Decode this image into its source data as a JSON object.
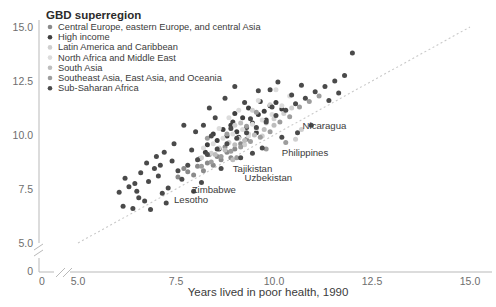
{
  "chart_data": {
    "type": "scatter",
    "title": "",
    "xlabel": "Years lived in poor health, 1990",
    "ylabel": "",
    "xlim": [
      5.0,
      15.0
    ],
    "ylim": [
      5.0,
      15.0
    ],
    "xticks": [
      "0",
      "5.0",
      "7.5",
      "10.0",
      "12.5",
      "15.0"
    ],
    "yticks": [
      "0",
      "5.0",
      "7.5",
      "10.0",
      "12.5",
      "15.0"
    ],
    "axis_break": true,
    "grid": false,
    "reference_line": {
      "type": "identity",
      "style": "dotted",
      "from": [
        5.0,
        5.0
      ],
      "to": [
        15.0,
        15.0
      ]
    },
    "legend": {
      "title": "GBD superregion",
      "position": "top-left",
      "entries": [
        {
          "label": "Central Europe, eastern Europe, and central Asia",
          "color": "#8a8a8a"
        },
        {
          "label": "High income",
          "color": "#3f3f3f"
        },
        {
          "label": "Latin America and Caribbean",
          "color": "#cfcfcf"
        },
        {
          "label": "North Africa and Middle East",
          "color": "#dcdcdc"
        },
        {
          "label": "South Asia",
          "color": "#bdbdbd"
        },
        {
          "label": "Southeast Asia, East Asia, and Oceania",
          "color": "#9d9d9d"
        },
        {
          "label": "Sub-Saharan Africa",
          "color": "#4a4a4a"
        }
      ]
    },
    "annotations": [
      {
        "text": "Nicaragua",
        "x": 10.73,
        "y": 10.3
      },
      {
        "text": "Philippines",
        "x": 10.2,
        "y": 9.05
      },
      {
        "text": "Tajikistan",
        "x": 8.95,
        "y": 8.3
      },
      {
        "text": "Uzbekistan",
        "x": 9.25,
        "y": 7.85
      },
      {
        "text": "Zimbabwe",
        "x": 7.9,
        "y": 7.3
      },
      {
        "text": "Lesotho",
        "x": 7.45,
        "y": 6.85
      }
    ],
    "series": [
      {
        "name": "Central Europe, eastern Europe, and central Asia",
        "color": "#8a8a8a",
        "points": [
          [
            7.55,
            8.05
          ],
          [
            7.8,
            8.3
          ],
          [
            8.05,
            8.55
          ],
          [
            8.3,
            8.7
          ],
          [
            8.55,
            9.0
          ],
          [
            8.8,
            9.2
          ],
          [
            8.2,
            8.35
          ],
          [
            8.65,
            8.85
          ],
          [
            7.95,
            8.15
          ],
          [
            9.0,
            9.35
          ],
          [
            8.45,
            8.6
          ],
          [
            8.1,
            8.9
          ],
          [
            8.75,
            9.45
          ],
          [
            9.15,
            9.6
          ],
          [
            7.7,
            8.45
          ],
          [
            8.9,
            8.95
          ],
          [
            8.35,
            9.1
          ],
          [
            9.3,
            9.8
          ]
        ]
      },
      {
        "name": "High income",
        "color": "#3f3f3f",
        "points": [
          [
            8.3,
            9.55
          ],
          [
            8.55,
            9.75
          ],
          [
            8.8,
            9.95
          ],
          [
            9.05,
            10.15
          ],
          [
            9.3,
            10.35
          ],
          [
            8.95,
            10.6
          ],
          [
            9.2,
            10.8
          ],
          [
            8.7,
            10.25
          ],
          [
            9.45,
            10.55
          ],
          [
            9.6,
            10.95
          ],
          [
            8.45,
            10.05
          ],
          [
            9.75,
            11.1
          ],
          [
            9.1,
            9.9
          ],
          [
            8.9,
            10.45
          ],
          [
            9.35,
            11.25
          ],
          [
            9.9,
            11.35
          ],
          [
            8.6,
            9.35
          ],
          [
            10.05,
            11.5
          ],
          [
            9.55,
            10.1
          ],
          [
            9.8,
            10.7
          ],
          [
            10.2,
            11.2
          ],
          [
            9.0,
            11.0
          ],
          [
            8.25,
            9.2
          ],
          [
            9.65,
            11.55
          ]
        ]
      },
      {
        "name": "Latin America and Caribbean",
        "color": "#cfcfcf",
        "points": [
          [
            8.6,
            9.4
          ],
          [
            8.85,
            9.65
          ],
          [
            9.1,
            9.85
          ],
          [
            9.35,
            10.05
          ],
          [
            9.55,
            10.3
          ],
          [
            9.8,
            10.55
          ],
          [
            8.4,
            9.15
          ],
          [
            10.0,
            10.75
          ],
          [
            9.25,
            9.55
          ],
          [
            10.25,
            11.0
          ],
          [
            9.7,
            9.95
          ],
          [
            10.45,
            11.25
          ],
          [
            9.0,
            10.45
          ],
          [
            10.7,
            10.25
          ],
          [
            9.9,
            11.4
          ],
          [
            8.15,
            8.95
          ],
          [
            10.55,
            9.8
          ],
          [
            9.45,
            11.15
          ]
        ]
      },
      {
        "name": "North Africa and Middle East",
        "color": "#dcdcdc",
        "points": [
          [
            8.45,
            9.6
          ],
          [
            8.7,
            9.85
          ],
          [
            8.95,
            10.05
          ],
          [
            9.2,
            10.25
          ],
          [
            9.45,
            10.5
          ],
          [
            9.7,
            10.7
          ],
          [
            8.2,
            9.4
          ],
          [
            9.95,
            10.95
          ],
          [
            9.1,
            11.15
          ],
          [
            10.2,
            11.35
          ],
          [
            8.85,
            10.8
          ],
          [
            9.6,
            11.6
          ],
          [
            10.4,
            11.8
          ],
          [
            9.35,
            9.95
          ],
          [
            8.6,
            10.3
          ],
          [
            10.05,
            12.1
          ]
        ]
      },
      {
        "name": "South Asia",
        "color": "#bdbdbd",
        "points": [
          [
            8.75,
            9.3
          ],
          [
            9.0,
            9.55
          ],
          [
            9.25,
            9.75
          ],
          [
            9.5,
            10.0
          ],
          [
            8.5,
            9.1
          ],
          [
            9.75,
            10.25
          ],
          [
            9.15,
            10.55
          ],
          [
            10.0,
            10.45
          ],
          [
            8.95,
            8.85
          ]
        ]
      },
      {
        "name": "Southeast Asia, East Asia, and Oceania",
        "color": "#9d9d9d",
        "points": [
          [
            8.4,
            8.75
          ],
          [
            8.65,
            9.0
          ],
          [
            8.9,
            9.25
          ],
          [
            9.15,
            9.45
          ],
          [
            9.4,
            9.7
          ],
          [
            9.65,
            9.9
          ],
          [
            8.15,
            8.55
          ],
          [
            9.9,
            10.15
          ],
          [
            9.3,
            10.4
          ],
          [
            10.15,
            10.6
          ],
          [
            8.8,
            10.05
          ],
          [
            10.4,
            10.85
          ],
          [
            9.55,
            11.05
          ],
          [
            10.65,
            11.3
          ],
          [
            9.05,
            8.95
          ],
          [
            10.9,
            11.55
          ],
          [
            9.8,
            9.35
          ],
          [
            11.15,
            11.8
          ],
          [
            10.3,
            9.65
          ],
          [
            8.3,
            9.85
          ]
        ]
      },
      {
        "name": "Sub-Saharan Africa",
        "color": "#4a4a4a",
        "points": [
          [
            6.05,
            7.35
          ],
          [
            6.3,
            7.6
          ],
          [
            6.55,
            7.1
          ],
          [
            6.8,
            7.85
          ],
          [
            7.05,
            8.1
          ],
          [
            7.3,
            7.55
          ],
          [
            6.2,
            8.0
          ],
          [
            7.55,
            8.35
          ],
          [
            6.7,
            6.95
          ],
          [
            7.8,
            8.6
          ],
          [
            7.15,
            7.3
          ],
          [
            8.05,
            8.85
          ],
          [
            6.45,
            7.75
          ],
          [
            8.3,
            9.1
          ],
          [
            7.4,
            8.8
          ],
          [
            8.55,
            9.35
          ],
          [
            6.95,
            8.45
          ],
          [
            8.8,
            9.6
          ],
          [
            7.65,
            7.95
          ],
          [
            9.05,
            9.85
          ],
          [
            6.6,
            8.25
          ],
          [
            9.3,
            10.1
          ],
          [
            7.9,
            9.3
          ],
          [
            9.55,
            10.35
          ],
          [
            8.15,
            7.8
          ],
          [
            9.8,
            10.6
          ],
          [
            8.4,
            9.95
          ],
          [
            10.05,
            10.9
          ],
          [
            8.65,
            8.45
          ],
          [
            10.3,
            11.15
          ],
          [
            8.9,
            10.3
          ],
          [
            10.55,
            11.45
          ],
          [
            9.15,
            8.95
          ],
          [
            10.8,
            11.7
          ],
          [
            9.4,
            10.75
          ],
          [
            11.05,
            12.0
          ],
          [
            9.7,
            9.4
          ],
          [
            11.3,
            12.25
          ],
          [
            9.95,
            11.3
          ],
          [
            11.55,
            12.5
          ],
          [
            10.2,
            9.9
          ],
          [
            11.8,
            12.75
          ],
          [
            10.45,
            11.85
          ],
          [
            12.0,
            13.8
          ],
          [
            6.15,
            6.7
          ],
          [
            6.85,
            6.55
          ],
          [
            7.25,
            6.85
          ],
          [
            7.0,
            9.0
          ],
          [
            8.2,
            10.45
          ],
          [
            8.5,
            10.8
          ],
          [
            9.25,
            11.5
          ],
          [
            10.7,
            12.3
          ],
          [
            7.45,
            9.6
          ],
          [
            6.4,
            6.6
          ],
          [
            10.95,
            10.45
          ],
          [
            9.6,
            12.05
          ],
          [
            8.0,
            10.15
          ],
          [
            11.4,
            11.6
          ],
          [
            7.7,
            10.45
          ],
          [
            9.0,
            12.25
          ],
          [
            6.75,
            8.7
          ],
          [
            10.1,
            12.45
          ],
          [
            7.2,
            9.2
          ],
          [
            8.75,
            11.7
          ],
          [
            11.65,
            11.95
          ],
          [
            6.5,
            7.4
          ],
          [
            9.45,
            9.15
          ],
          [
            10.6,
            10.1
          ],
          [
            8.35,
            11.25
          ],
          [
            7.95,
            7.4
          ],
          [
            9.9,
            12.1
          ],
          [
            7.1,
            8.6
          ]
        ]
      }
    ]
  }
}
